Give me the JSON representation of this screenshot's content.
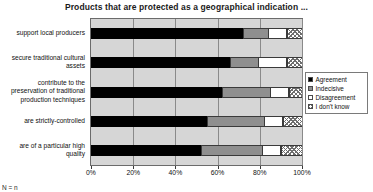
{
  "chart_data": {
    "type": "bar",
    "orientation": "horizontal",
    "stacked": true,
    "normalized": true,
    "title": "Products that are protected as a geographical indication ...",
    "xlabel": "",
    "ylabel": "",
    "xlim": [
      0,
      100
    ],
    "xticks": [
      0,
      20,
      40,
      60,
      80,
      100
    ],
    "xtick_labels": [
      "0%",
      "20%",
      "40%",
      "60%",
      "80%",
      "100%"
    ],
    "grid": true,
    "legend_position": "right",
    "categories": [
      "support local producers",
      "secure traditional cultural assets",
      "contribute to the preservation of traditional production techniques",
      "are strictly-controlled",
      "are of a particular high quality"
    ],
    "series": [
      {
        "name": "Agreement",
        "color": "#000000",
        "pattern": "solid",
        "values": [
          72,
          66,
          62,
          55,
          52
        ]
      },
      {
        "name": "Indecisive",
        "color": "#8f8f8f",
        "pattern": "solid",
        "values": [
          12,
          13,
          23,
          27,
          29
        ]
      },
      {
        "name": "Disagreement",
        "color": "#ffffff",
        "pattern": "solid",
        "values": [
          9,
          14,
          9,
          9,
          9
        ]
      },
      {
        "name": "I don't know",
        "color": "#ffffff",
        "pattern": "crosshatch",
        "values": [
          7,
          7,
          6,
          9,
          10
        ]
      }
    ]
  },
  "legend": {
    "items": [
      {
        "label": "Agreement",
        "swatch": "swatch-agreement-icon"
      },
      {
        "label": "Indecisive",
        "swatch": "swatch-indecisive-icon"
      },
      {
        "label": "Disagreement",
        "swatch": "swatch-disagreement-icon"
      },
      {
        "label": "I don't know",
        "swatch": "swatch-dontknow-icon"
      }
    ]
  },
  "footnote": "N =  n"
}
